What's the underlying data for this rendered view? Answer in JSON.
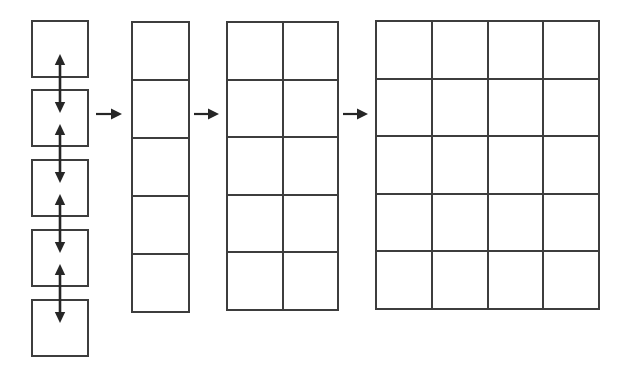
{
  "diagram": {
    "canvas": {
      "width": 627,
      "height": 376,
      "background": "#ffffff"
    },
    "style": {
      "line_color": "#3d3d3d",
      "line_width_px": 2,
      "arrow_color": "#262626",
      "cell_size_px": 58
    },
    "stages": [
      {
        "id": "stage-1",
        "name": "separate-squares",
        "label": "",
        "columns": 1,
        "rows": 5,
        "separated": true,
        "x": 31,
        "y": 20,
        "cell_w": 58,
        "cell_h": 58,
        "row_tops": [
          20,
          89,
          159,
          229,
          299
        ],
        "connector": "double-headed-vertical-arrow",
        "connector_count": 4
      },
      {
        "id": "stage-2",
        "name": "single-column-grid",
        "label": "",
        "columns": 1,
        "rows": 5,
        "separated": false,
        "x": 131,
        "y": 21,
        "cell_w": 57,
        "cell_h": 58
      },
      {
        "id": "stage-3",
        "name": "two-column-grid",
        "label": "",
        "columns": 2,
        "rows": 5,
        "separated": false,
        "x": 226,
        "y": 21,
        "cell_w": 55.5,
        "cell_h": 57.6
      },
      {
        "id": "stage-4",
        "name": "four-column-grid",
        "label": "",
        "columns": 4,
        "rows": 5,
        "separated": false,
        "x": 375,
        "y": 20,
        "cell_w": 55.75,
        "cell_h": 57.6
      }
    ],
    "flow_arrows": [
      {
        "id": "flow-1",
        "name": "arrow-stage1-to-stage2",
        "x": 96,
        "y": 114,
        "length": 26,
        "direction": "right"
      },
      {
        "id": "flow-2",
        "name": "arrow-stage2-to-stage3",
        "x": 194,
        "y": 114,
        "length": 25,
        "direction": "right"
      },
      {
        "id": "flow-3",
        "name": "arrow-stage3-to-stage4",
        "x": 343,
        "y": 114,
        "length": 25,
        "direction": "right"
      }
    ],
    "vertical_arrows": [
      {
        "id": "vert-1",
        "name": "double-arrow-between-square-1-and-2",
        "cx": 60,
        "top": 54,
        "bottom": 113
      },
      {
        "id": "vert-2",
        "name": "double-arrow-between-square-2-and-3",
        "cx": 60,
        "top": 124,
        "bottom": 183
      },
      {
        "id": "vert-3",
        "name": "double-arrow-between-square-3-and-4",
        "cx": 60,
        "top": 194,
        "bottom": 253
      },
      {
        "id": "vert-4",
        "name": "double-arrow-between-square-4-and-5",
        "cx": 60,
        "top": 264,
        "bottom": 323
      }
    ]
  }
}
